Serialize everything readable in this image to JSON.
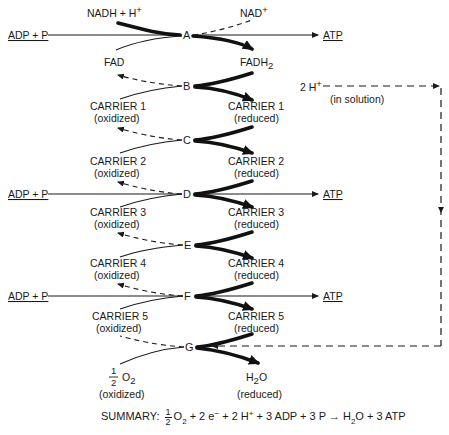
{
  "diagram": {
    "nodes": [
      "A",
      "B",
      "C",
      "D",
      "E",
      "F",
      "G"
    ],
    "node_A": "A",
    "node_B": "B",
    "node_C": "C",
    "node_D": "D",
    "node_E": "E",
    "node_F": "F",
    "node_G": "G",
    "top": {
      "nadh": "NADH + H",
      "nadh_sup": "+",
      "nad": "NAD",
      "nad_sup": "+"
    },
    "atp_inputs": {
      "adp_p_label": "ADP + P",
      "atp_label": "ATP"
    },
    "left": {
      "fad": "FAD",
      "carrier1": "CARRIER 1",
      "carrier2": "CARRIER 2",
      "carrier3": "CARRIER 3",
      "carrier4": "CARRIER 4",
      "carrier5": "CARRIER 5",
      "oxidized": "(oxidized)",
      "o2_num": "1",
      "o2_den": "2",
      "o2": "O",
      "o2_sub": "2"
    },
    "right": {
      "fadh": "FADH",
      "fadh_sub": "2",
      "carrier1": "CARRIER 1",
      "carrier2": "CARRIER 2",
      "carrier3": "CARRIER 3",
      "carrier4": "CARRIER 4",
      "carrier5": "CARRIER 5",
      "reduced": "(reduced)",
      "h2o_h": "H",
      "h2o_sub": "2",
      "h2o_o": "O"
    },
    "protons": {
      "label": "2 H",
      "sup": "+",
      "note": "(in solution)"
    }
  },
  "summary": {
    "prefix": "SUMMARY:",
    "half_num": "1",
    "half_den": "2",
    "o2": "O",
    "o2_sub": "2",
    "e_part": "+ 2 e",
    "e_sup": "−",
    "h_part": "+ 2 H",
    "h_sup": "+",
    "rest": "+ 3 ADP + 3 P",
    "arrow": "→",
    "products": "H",
    "h2o_sub": "2",
    "products_rest": "O + 3 ATP"
  }
}
